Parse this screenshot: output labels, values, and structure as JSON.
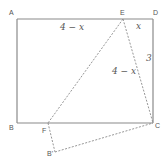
{
  "diagram": {
    "type": "geometry-fold",
    "vertices": {
      "A": {
        "label": "A",
        "x": 17,
        "y": 19
      },
      "B": {
        "label": "B",
        "x": 17,
        "y": 123
      },
      "C": {
        "label": "C",
        "x": 153,
        "y": 123
      },
      "D": {
        "label": "D",
        "x": 153,
        "y": 19
      },
      "E": {
        "label": "E",
        "x": 123,
        "y": 19
      },
      "F": {
        "label": "F",
        "x": 48,
        "y": 123
      },
      "B_prime": {
        "label": "B'",
        "x": 55,
        "y": 152
      }
    },
    "segment_labels": {
      "AE": "4 − x",
      "ED": "x",
      "DC": "3",
      "EC": "4 − x"
    },
    "edges_solid": [
      "AB",
      "BC",
      "CD",
      "DA"
    ],
    "edges_dashed": [
      "EF",
      "EC",
      "FB'",
      "B'C"
    ]
  }
}
